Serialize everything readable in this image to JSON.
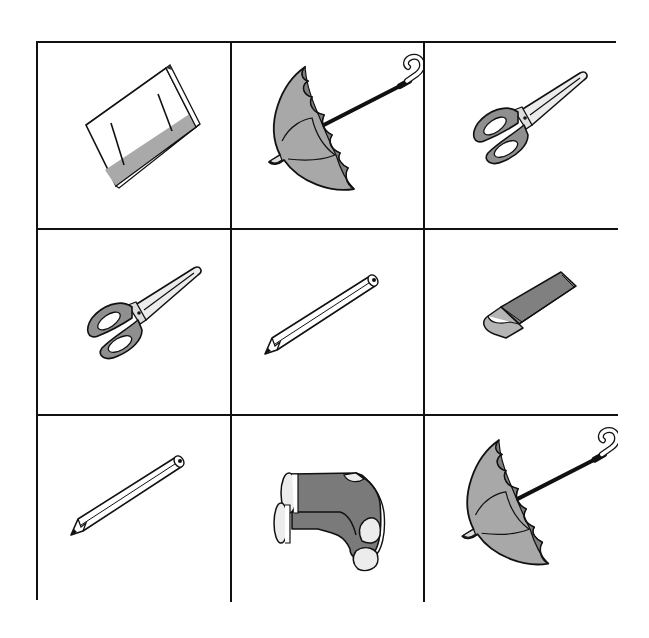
{
  "puzzle": {
    "rows": 3,
    "cols": 3,
    "cells": [
      {
        "row": 1,
        "col": 1,
        "item": "book"
      },
      {
        "row": 1,
        "col": 2,
        "item": "umbrella"
      },
      {
        "row": 1,
        "col": 3,
        "item": "scissors"
      },
      {
        "row": 2,
        "col": 1,
        "item": "scissors"
      },
      {
        "row": 2,
        "col": 2,
        "item": "pencil"
      },
      {
        "row": 2,
        "col": 3,
        "item": "eraser"
      },
      {
        "row": 3,
        "col": 1,
        "item": "pencil"
      },
      {
        "row": 3,
        "col": 2,
        "item": "socks"
      },
      {
        "row": 3,
        "col": 3,
        "item": "umbrella"
      }
    ]
  },
  "colors": {
    "line": "#111111",
    "gray_light": "#a6a6a6",
    "gray_mid": "#8c8c8c",
    "gray_dark": "#777777",
    "white": "#ffffff"
  }
}
